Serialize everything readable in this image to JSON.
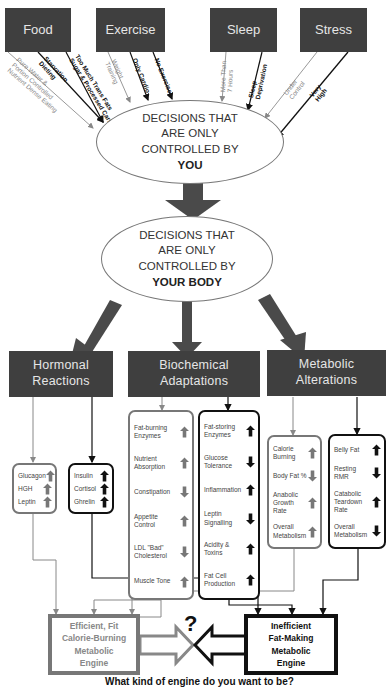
{
  "top_factors": [
    {
      "label": "Food"
    },
    {
      "label": "Exercise"
    },
    {
      "label": "Sleep"
    },
    {
      "label": "Stress"
    }
  ],
  "choices": {
    "food": [
      {
        "label": "Pure Water &",
        "style": "grey"
      },
      {
        "label": "Portion Controlled",
        "style": "grey"
      },
      {
        "label": "Nutrient Dense Eating",
        "style": "grey"
      },
      {
        "label": "Starvation",
        "style": "black"
      },
      {
        "label": "Dieting",
        "style": "black"
      },
      {
        "label": "Too Much Trans Fats",
        "style": "black"
      },
      {
        "label": "Sugar & Processed Carbs",
        "style": "black"
      }
    ],
    "exercise": [
      {
        "label": "Weight",
        "style": "grey"
      },
      {
        "label": "Training",
        "style": "grey"
      },
      {
        "label": "Only Cardio",
        "style": "black"
      },
      {
        "label": "No Exercise",
        "style": "black"
      }
    ],
    "sleep": [
      {
        "label": "More Than",
        "style": "grey"
      },
      {
        "label": "7 Hours",
        "style": "grey"
      },
      {
        "label": "Sleep",
        "style": "black"
      },
      {
        "label": "Deprivation",
        "style": "black"
      }
    ],
    "stress": [
      {
        "label": "Under",
        "style": "grey"
      },
      {
        "label": "Control",
        "style": "grey"
      },
      {
        "label": "Very",
        "style": "black"
      },
      {
        "label": "High",
        "style": "black"
      }
    ]
  },
  "ellipse_you": {
    "line1": "DECISIONS THAT",
    "line2": "ARE ONLY",
    "line3": "CONTROLLED BY",
    "emphasis": "YOU"
  },
  "ellipse_body": {
    "line1": "DECISIONS THAT",
    "line2": "ARE ONLY",
    "line3": "CONTROLLED BY",
    "emphasis": "YOUR BODY"
  },
  "categories": [
    {
      "line1": "Hormonal",
      "line2": "Reactions"
    },
    {
      "line1": "Biochemical",
      "line2": "Adaptations"
    },
    {
      "line1": "Metabolic",
      "line2": "Alterations"
    }
  ],
  "panels": {
    "hormonal_good": [
      {
        "label": "Glucagon",
        "dir": "up"
      },
      {
        "label": "HGH",
        "dir": "up"
      },
      {
        "label": "Leptin",
        "dir": "up"
      }
    ],
    "hormonal_bad": [
      {
        "label": "Insulin",
        "dir": "up"
      },
      {
        "label": "Cortisol",
        "dir": "up"
      },
      {
        "label": "Ghrelin",
        "dir": "up"
      }
    ],
    "biochem_good": [
      {
        "label": "Fat-burning Enzymes",
        "dir": "up"
      },
      {
        "label": "Nutrient Absorption",
        "dir": "up"
      },
      {
        "label": "Constipation",
        "dir": "down"
      },
      {
        "label": "Appetite Control",
        "dir": "up"
      },
      {
        "label": "LDL \"Bad\" Cholesterol",
        "dir": "down"
      },
      {
        "label": "Muscle Tone",
        "dir": "up"
      }
    ],
    "biochem_bad": [
      {
        "label": "Fat-storing Enzymes",
        "dir": "up"
      },
      {
        "label": "Glucose Tolerance",
        "dir": "down"
      },
      {
        "label": "Inflammation",
        "dir": "up"
      },
      {
        "label": "Leptin Signalling",
        "dir": "down"
      },
      {
        "label": "Acidity & Toxins",
        "dir": "up"
      },
      {
        "label": "Fat Cell Production",
        "dir": "up"
      }
    ],
    "metabolic_good": [
      {
        "label": "Calorie Burning",
        "dir": "up"
      },
      {
        "label": "Body Fat %",
        "dir": "down"
      },
      {
        "label": "Anabolic Growth Rate",
        "dir": "up"
      },
      {
        "label": "Overall Metabolism",
        "dir": "up"
      }
    ],
    "metabolic_bad": [
      {
        "label": "Belly Fat",
        "dir": "up"
      },
      {
        "label": "Resting RMR",
        "dir": "down"
      },
      {
        "label": "Catabolic Teardown Rate",
        "dir": "up"
      },
      {
        "label": "Overall Metabolism",
        "dir": "down"
      }
    ]
  },
  "engines": {
    "good": {
      "line1": "Efficient, Fit",
      "line2": "Calorie-Burning",
      "line3": "Metabolic",
      "line4": "Engine"
    },
    "bad": {
      "line1": "Inefficient",
      "line2": "Fat-Making",
      "line3": "Metabolic",
      "line4": "Engine"
    },
    "question": "?"
  },
  "caption": "What kind of engine do you want to be?",
  "colors": {
    "box_dark": "#3f3f3f",
    "good_grey": "#777777",
    "bad_black": "#111111",
    "arrow_main": "#4a4a4a"
  }
}
